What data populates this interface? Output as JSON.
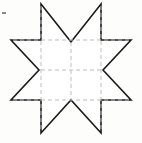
{
  "figure": {
    "canvas": {
      "width": 142,
      "height": 143,
      "background_color": "#fdfdfb"
    },
    "outline": {
      "name": "cross-star-polygon",
      "stroke_color": "#1a1a1a",
      "fill_color": "#ffffff",
      "stroke_width": 1.6,
      "style": "solid",
      "vertex_count": 12,
      "points": "41,4 71,42 101,4 101,40 131,40 103,70 131,100 101,100 101,133 71,100 41,133 41,100 11,100 39,70 11,40 41,40",
      "vertices": [
        {
          "name": "top-left-peak",
          "x": 41,
          "y": 4
        },
        {
          "name": "top-center-notch",
          "x": 71,
          "y": 42
        },
        {
          "name": "top-right-peak",
          "x": 101,
          "y": 4
        },
        {
          "name": "inner-top-right",
          "x": 101,
          "y": 40
        },
        {
          "name": "right-top-vertex",
          "x": 131,
          "y": 40
        },
        {
          "name": "right-center-notch",
          "x": 103,
          "y": 70
        },
        {
          "name": "right-bottom-vertex",
          "x": 131,
          "y": 100
        },
        {
          "name": "inner-bottom-right",
          "x": 101,
          "y": 100
        },
        {
          "name": "bottom-right-peak",
          "x": 101,
          "y": 133
        },
        {
          "name": "bottom-center-notch",
          "x": 71,
          "y": 100
        },
        {
          "name": "bottom-left-peak",
          "x": 41,
          "y": 133
        },
        {
          "name": "inner-bottom-left",
          "x": 41,
          "y": 100
        },
        {
          "name": "left-bottom-vertex",
          "x": 11,
          "y": 100
        },
        {
          "name": "left-center-notch",
          "x": 39,
          "y": 70
        },
        {
          "name": "left-top-vertex",
          "x": 11,
          "y": 40
        },
        {
          "name": "inner-top-left",
          "x": 41,
          "y": 40
        }
      ]
    },
    "grid": {
      "name": "construction-grid",
      "stroke_color": "#bdbdbd",
      "stroke_width": 1,
      "style": "dashed",
      "dash_pattern": "4 3",
      "columns_x": [
        41,
        71,
        101
      ],
      "rows_y": [
        40,
        70,
        100
      ],
      "segments": [
        {
          "name": "vertical-left",
          "orientation": "vertical",
          "x1": 41,
          "y1": 6,
          "x2": 41,
          "y2": 131
        },
        {
          "name": "vertical-center",
          "orientation": "vertical",
          "x1": 71,
          "y1": 42,
          "x2": 71,
          "y2": 99
        },
        {
          "name": "vertical-right",
          "orientation": "vertical",
          "x1": 101,
          "y1": 6,
          "x2": 101,
          "y2": 131
        },
        {
          "name": "horizontal-top",
          "orientation": "horizontal",
          "x1": 13,
          "y1": 40,
          "x2": 129,
          "y2": 40
        },
        {
          "name": "horizontal-middle",
          "orientation": "horizontal",
          "x1": 41,
          "y1": 70,
          "x2": 101,
          "y2": 70
        },
        {
          "name": "horizontal-bottom",
          "orientation": "horizontal",
          "x1": 13,
          "y1": 100,
          "x2": 129,
          "y2": 100
        }
      ]
    },
    "marks": [
      {
        "name": "stray-speck-left",
        "x": 2,
        "y": 12,
        "width": 4,
        "height": 2,
        "color": "#8a8a8a"
      }
    ]
  }
}
